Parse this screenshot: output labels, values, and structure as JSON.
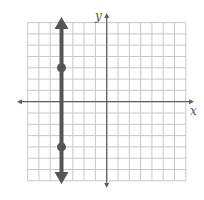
{
  "chart_data": {
    "type": "line",
    "title": "",
    "xlabel": "x",
    "ylabel": "y",
    "xlim": [
      -7,
      7
    ],
    "ylim": [
      -7,
      7
    ],
    "grid": true,
    "grid_step": 1,
    "tick_labels": false,
    "series": [
      {
        "name": "vertical line x = -4",
        "kind": "vertical-line-with-arrows",
        "x": -4,
        "points": [
          {
            "x": -4,
            "y": 3
          },
          {
            "x": -4,
            "y": -4
          }
        ]
      }
    ]
  },
  "labels": {
    "x_axis": "x",
    "y_axis": "y"
  },
  "colors": {
    "grid": "#c8c8c8",
    "axis": "#5f5f5f",
    "line": "#555555",
    "point": "#555555"
  }
}
